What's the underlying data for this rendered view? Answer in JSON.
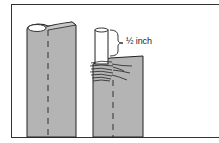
{
  "figure": {
    "type": "technical-illustration",
    "annotation": {
      "label": "½ inch"
    },
    "colors": {
      "panel_fill": "#b4b4b4",
      "line": "#222222",
      "background": "#ffffff",
      "dowel_fill": "#ffffff"
    }
  }
}
